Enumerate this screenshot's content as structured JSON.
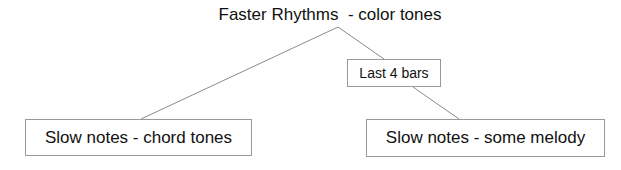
{
  "diagram": {
    "type": "tree",
    "root": {
      "label": "Faster Rhythms  - color tones"
    },
    "nodes": [
      {
        "id": "last4",
        "label": "Last 4 bars"
      },
      {
        "id": "chord",
        "label": "Slow notes - chord tones"
      },
      {
        "id": "melody",
        "label": "Slow notes - some melody"
      }
    ],
    "edges": [
      {
        "from": "root",
        "to": "chord"
      },
      {
        "from": "root",
        "to": "last4"
      },
      {
        "from": "last4",
        "to": "melody"
      }
    ],
    "colors": {
      "background": "#ffffff",
      "text": "#111111",
      "line": "#8a8a8a",
      "border": "#9a9a9a"
    }
  }
}
